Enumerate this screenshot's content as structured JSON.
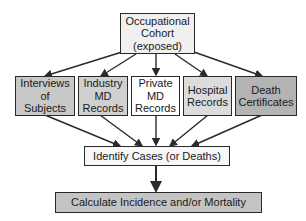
{
  "diagram": {
    "top": {
      "lines": [
        "Occupational",
        "Cohort",
        "(exposed)"
      ],
      "fill": "#f0f0f0"
    },
    "sources": [
      {
        "lines": [
          "Interviews",
          "of",
          "Subjects"
        ],
        "fill": "#c8c8c8"
      },
      {
        "lines": [
          "Industry",
          "MD",
          "Records"
        ],
        "fill": "#d0d0d0"
      },
      {
        "lines": [
          "Private",
          "MD",
          "Records"
        ],
        "fill": "#ffffff"
      },
      {
        "lines": [
          "Hospital",
          "Records"
        ],
        "fill": "#dcdcdc"
      },
      {
        "lines": [
          "Death",
          "Certificates"
        ],
        "fill": "#b4b4b4"
      }
    ],
    "identify": {
      "label": "Identify Cases (or Deaths)",
      "fill": "#f7f7f7"
    },
    "calculate": {
      "label": "Calculate Incidence and/or Mortality",
      "fill": "#c4c4c4"
    },
    "arrow_color": "#2a2a2a"
  }
}
